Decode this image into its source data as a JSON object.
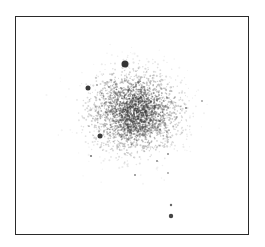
{
  "figure": {
    "type": "network-graph",
    "frame": {
      "x": 15,
      "y": 16,
      "width": 234,
      "height": 219,
      "border_color": "#2a2a2a"
    },
    "cluster": {
      "center_x": 135,
      "center_y": 112,
      "spread_x": 22,
      "spread_y": 20,
      "point_count": 2600,
      "color": "#3a3a3a"
    },
    "hub_nodes": [
      {
        "x": 125,
        "y": 64,
        "r": 3.5,
        "color": "#333333"
      },
      {
        "x": 88,
        "y": 88,
        "r": 2.5,
        "color": "#3a3a3a"
      },
      {
        "x": 100,
        "y": 136,
        "r": 2.5,
        "color": "#3a3a3a"
      },
      {
        "x": 171,
        "y": 216,
        "r": 2.2,
        "color": "#444444"
      },
      {
        "x": 171,
        "y": 205,
        "r": 1.2,
        "color": "#666666"
      },
      {
        "x": 91,
        "y": 156,
        "r": 1.1,
        "color": "#777777"
      },
      {
        "x": 135,
        "y": 175,
        "r": 1.0,
        "color": "#888888"
      },
      {
        "x": 202,
        "y": 101,
        "r": 0.9,
        "color": "#999999"
      },
      {
        "x": 186,
        "y": 108,
        "r": 1.0,
        "color": "#777777"
      },
      {
        "x": 168,
        "y": 154,
        "r": 1.0,
        "color": "#888888"
      },
      {
        "x": 157,
        "y": 161,
        "r": 1.0,
        "color": "#888888"
      },
      {
        "x": 168,
        "y": 173,
        "r": 0.9,
        "color": "#999999"
      },
      {
        "x": 97,
        "y": 85,
        "r": 0.9,
        "color": "#999999"
      }
    ]
  }
}
